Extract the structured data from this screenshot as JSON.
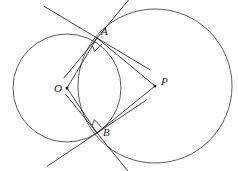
{
  "figure": {
    "background_color": "#ffffff",
    "stroke_color": "#3a3a3a",
    "label_color": "#1a1a1a",
    "width": 238,
    "height": 171
  },
  "labels": {
    "center_left": "O",
    "center_right": "P",
    "intersection_top": "A",
    "intersection_bottom": "B"
  },
  "geometry": {
    "circle_left": {
      "cx": 67,
      "cy": 88,
      "r": 54,
      "center_label": "O"
    },
    "circle_right": {
      "cx": 155,
      "cy": 86,
      "r": 77,
      "center_label": "P"
    },
    "point_A": {
      "x": 97,
      "y": 38
    },
    "point_B": {
      "x": 97,
      "y": 133
    },
    "point_O": {
      "x": 67,
      "y": 88
    },
    "point_P": {
      "x": 155,
      "y": 86
    },
    "segments": [
      {
        "name": "OA",
        "from": "O",
        "to": "A"
      },
      {
        "name": "OB",
        "from": "O",
        "to": "B"
      },
      {
        "name": "PA",
        "from": "P",
        "to": "A"
      },
      {
        "name": "PB",
        "from": "P",
        "to": "B"
      }
    ],
    "tangent_lines": [
      {
        "name": "tangent-left-at-A",
        "touches": "A",
        "tangent_to": "circle_left"
      },
      {
        "name": "tangent-right-at-A",
        "touches": "A",
        "tangent_to": "circle_right"
      },
      {
        "name": "tangent-left-at-B",
        "touches": "B",
        "tangent_to": "circle_left"
      },
      {
        "name": "tangent-right-at-B",
        "touches": "B",
        "tangent_to": "circle_right"
      }
    ],
    "right_angle_markers": [
      {
        "name": "right-angle-at-A",
        "at": "A",
        "between": [
          "OA",
          "PA"
        ]
      },
      {
        "name": "right-angle-at-B",
        "at": "B",
        "between": [
          "OB",
          "PB"
        ]
      }
    ]
  },
  "label_positions": {
    "O": {
      "x": 55,
      "y": 84
    },
    "P": {
      "x": 161,
      "y": 78
    },
    "A": {
      "x": 101,
      "y": 29
    },
    "B": {
      "x": 103,
      "y": 130
    }
  }
}
